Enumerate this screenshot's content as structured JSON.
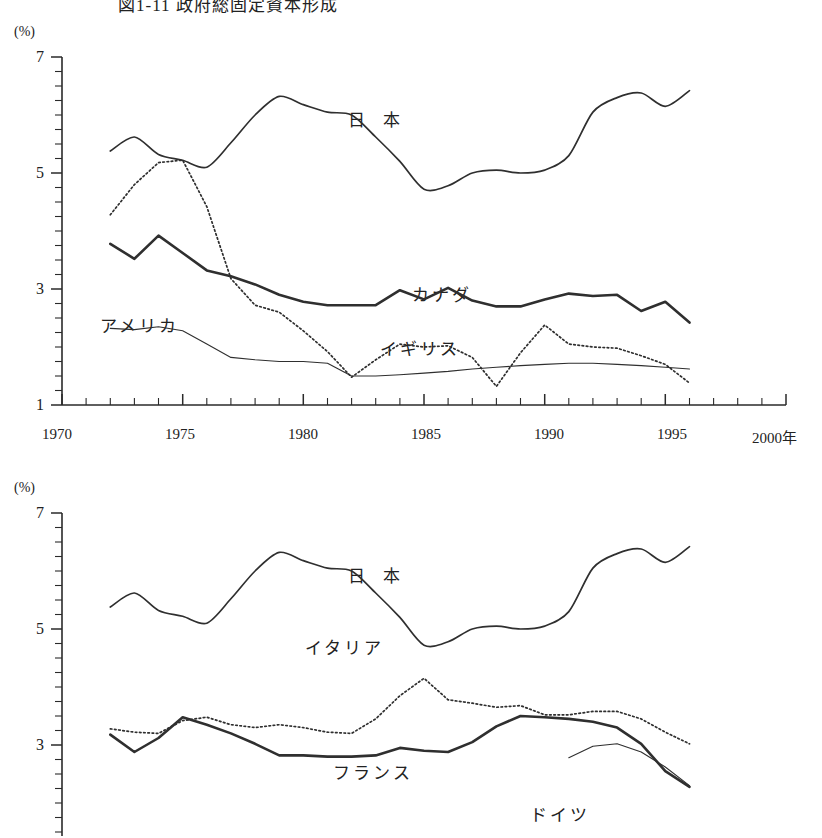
{
  "figure": {
    "title": "図1-11 政府総固定資本形成",
    "unit_label": "(%)",
    "x_axis_suffix": "年"
  },
  "charts": [
    {
      "id": "chart-upper",
      "unit": "(%)",
      "y_ticks": [
        "7",
        "5",
        "3",
        "1"
      ],
      "x_ticks": [
        "1970",
        "1975",
        "1980",
        "1985",
        "1990",
        "1995",
        "2000"
      ],
      "series_labels": [
        "日 本",
        "カナダ",
        "アメリカ",
        "イギリス"
      ]
    },
    {
      "id": "chart-lower",
      "unit": "(%)",
      "y_ticks": [
        "7",
        "5",
        "3"
      ],
      "series_labels": [
        "日 本",
        "イタリア",
        "フランス",
        "ドイツ"
      ]
    }
  ],
  "chart_data": [
    {
      "type": "line",
      "title": "政府総固定資本形成 (日本・カナダ・アメリカ・イギリス)",
      "xlabel": "年",
      "ylabel": "(%)",
      "xlim": [
        1970,
        2000
      ],
      "ylim": [
        1,
        7
      ],
      "grid": false,
      "legend": "inline-annotations",
      "x": [
        1972,
        1973,
        1974,
        1975,
        1976,
        1977,
        1978,
        1979,
        1980,
        1981,
        1982,
        1983,
        1984,
        1985,
        1986,
        1987,
        1988,
        1989,
        1990,
        1991,
        1992,
        1993,
        1994,
        1995,
        1996
      ],
      "series": [
        {
          "name": "日 本",
          "style": "solid-medium",
          "values": [
            5.38,
            5.62,
            5.32,
            5.22,
            5.1,
            5.52,
            6.0,
            6.32,
            6.18,
            6.05,
            6.0,
            5.62,
            5.2,
            4.72,
            4.78,
            5.0,
            5.05,
            5.0,
            5.05,
            5.3,
            6.05,
            6.3,
            6.38,
            6.15,
            6.42
          ]
        },
        {
          "name": "カナダ",
          "style": "solid-thick",
          "values": [
            3.78,
            3.52,
            3.92,
            3.62,
            3.32,
            3.22,
            3.08,
            2.9,
            2.78,
            2.72,
            2.72,
            2.72,
            2.98,
            2.82,
            3.02,
            2.8,
            2.7,
            2.7,
            2.82,
            2.92,
            2.88,
            2.9,
            2.62,
            2.78,
            2.42
          ]
        },
        {
          "name": "アメリカ",
          "style": "solid-thin",
          "values": [
            2.32,
            2.3,
            2.35,
            2.28,
            2.05,
            1.82,
            1.78,
            1.75,
            1.75,
            1.72,
            1.5,
            1.5,
            1.52,
            1.55,
            1.58,
            1.62,
            1.65,
            1.68,
            1.7,
            1.72,
            1.72,
            1.7,
            1.68,
            1.65,
            1.62
          ]
        },
        {
          "name": "イギリス",
          "style": "dotted",
          "values": [
            4.28,
            4.8,
            5.18,
            5.22,
            4.42,
            3.18,
            2.72,
            2.6,
            2.28,
            1.92,
            1.48,
            1.78,
            2.05,
            2.0,
            2.02,
            1.82,
            1.32,
            1.9,
            2.38,
            2.05,
            2.0,
            1.98,
            1.85,
            1.7,
            1.38
          ]
        }
      ]
    },
    {
      "type": "line",
      "title": "政府総固定資本形成 (日本・イタリア・フランス・ドイツ)",
      "xlabel": "年",
      "ylabel": "(%)",
      "xlim": [
        1970,
        2000
      ],
      "ylim": [
        1,
        7
      ],
      "grid": false,
      "legend": "inline-annotations",
      "x": [
        1972,
        1973,
        1974,
        1975,
        1976,
        1977,
        1978,
        1979,
        1980,
        1981,
        1982,
        1983,
        1984,
        1985,
        1986,
        1987,
        1988,
        1989,
        1990,
        1991,
        1992,
        1993,
        1994,
        1995,
        1996
      ],
      "series": [
        {
          "name": "日 本",
          "style": "solid-medium",
          "values": [
            5.38,
            5.62,
            5.32,
            5.22,
            5.1,
            5.52,
            6.0,
            6.32,
            6.18,
            6.05,
            6.0,
            5.62,
            5.2,
            4.72,
            4.78,
            5.0,
            5.05,
            5.0,
            5.05,
            5.3,
            6.05,
            6.3,
            6.38,
            6.15,
            6.42
          ]
        },
        {
          "name": "イタリア",
          "style": "dotted",
          "values": [
            3.28,
            3.22,
            3.2,
            3.42,
            3.48,
            3.35,
            3.3,
            3.35,
            3.3,
            3.22,
            3.2,
            3.45,
            3.85,
            4.15,
            3.78,
            3.72,
            3.65,
            3.68,
            3.52,
            3.52,
            3.58,
            3.58,
            3.45,
            3.22,
            3.02
          ]
        },
        {
          "name": "フランス",
          "style": "solid-thick",
          "values": [
            3.18,
            2.88,
            3.12,
            3.48,
            3.35,
            3.2,
            3.02,
            2.82,
            2.82,
            2.8,
            2.8,
            2.82,
            2.95,
            2.9,
            2.88,
            3.05,
            3.32,
            3.5,
            3.48,
            3.45,
            3.4,
            3.3,
            3.02,
            2.55,
            2.28
          ]
        },
        {
          "name": "ドイツ",
          "style": "solid-thin",
          "values": [
            null,
            null,
            null,
            null,
            null,
            null,
            null,
            null,
            null,
            null,
            null,
            null,
            null,
            null,
            null,
            null,
            null,
            null,
            null,
            2.78,
            2.98,
            3.02,
            2.88,
            2.62,
            2.3
          ]
        }
      ]
    }
  ]
}
